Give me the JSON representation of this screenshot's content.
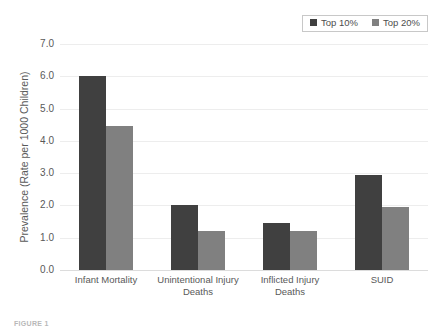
{
  "chart_data": {
    "type": "bar",
    "title": "",
    "xlabel": "",
    "ylabel": "Prevalence (Rate per 1000 Children)",
    "ylim": [
      0.0,
      7.0
    ],
    "ytick_labels": [
      "0.0",
      "1.0",
      "2.0",
      "3.0",
      "4.0",
      "5.0",
      "6.0",
      "7.0"
    ],
    "ytick_values": [
      0.0,
      1.0,
      2.0,
      3.0,
      4.0,
      5.0,
      6.0,
      7.0
    ],
    "grid": "horizontal",
    "legend_position": "top-right",
    "categories": [
      "Infant Mortality",
      "Unintentional Injury Deaths",
      "Inflicted Injury Deaths",
      "SUID"
    ],
    "series": [
      {
        "name": "Top 10%",
        "color": "#404040",
        "values": [
          6.0,
          2.0,
          1.45,
          2.95
        ]
      },
      {
        "name": "Top 20%",
        "color": "#808080",
        "values": [
          4.45,
          1.2,
          1.2,
          1.95
        ]
      }
    ]
  },
  "caption": "FIGURE 1"
}
